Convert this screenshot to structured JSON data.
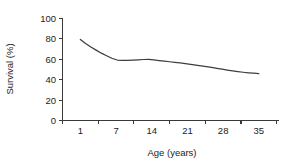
{
  "chart_data": {
    "type": "line",
    "title": "",
    "subtitle": "",
    "xlabel": "Age (years)",
    "ylabel": "Survival (%)",
    "xlim": [
      0,
      36
    ],
    "ylim": [
      0,
      100
    ],
    "xticks": [
      1,
      7,
      14,
      21,
      28,
      35
    ],
    "xtick_labels": [
      "1",
      "7",
      "14",
      "21",
      "28",
      "35"
    ],
    "yticks": [
      0,
      20,
      40,
      60,
      80,
      100
    ],
    "ytick_labels": [
      "0",
      "20",
      "40",
      "60",
      "80",
      "100"
    ],
    "grid": false,
    "legend": false,
    "legend_position": "none",
    "line_color": "#3d3d3d",
    "background_color": "#ffffff",
    "axis_color": "#3a3a3a",
    "series": [
      {
        "name": "Survival",
        "x": [
          1,
          2,
          3,
          4,
          5,
          6,
          7,
          8,
          9,
          10,
          11,
          12,
          13,
          14,
          15,
          16,
          17,
          18,
          19,
          20,
          21,
          22,
          23,
          24,
          25,
          26,
          27,
          28,
          29,
          30,
          31,
          32,
          33,
          34,
          35
        ],
        "values": [
          79.5,
          75.5,
          72.0,
          69.0,
          66.0,
          63.5,
          61.0,
          59.3,
          59.0,
          59.0,
          59.2,
          59.5,
          59.8,
          60.0,
          59.5,
          58.8,
          58.2,
          57.6,
          57.0,
          56.4,
          55.8,
          55.1,
          54.4,
          53.6,
          52.8,
          52.0,
          51.2,
          50.3,
          49.4,
          48.6,
          47.9,
          47.3,
          46.8,
          46.4,
          46.0
        ]
      }
    ],
    "annotations": []
  }
}
